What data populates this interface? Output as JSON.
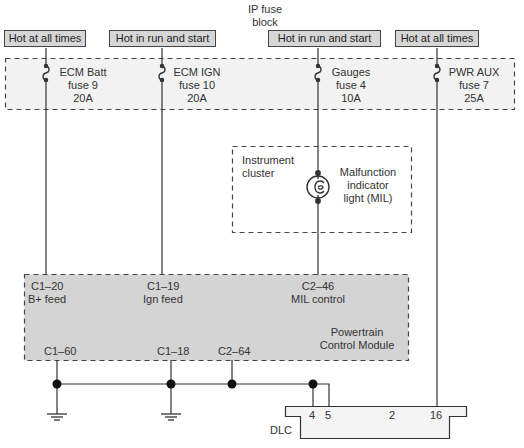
{
  "fuse_block": {
    "title_line1": "IP fuse",
    "title_line2": "block"
  },
  "power_labels": [
    {
      "label": "Hot at all times"
    },
    {
      "label": "Hot in run and start"
    },
    {
      "label": "Hot in run and start"
    },
    {
      "label": "Hot at all times"
    }
  ],
  "fuses": [
    {
      "name": "ECM Batt",
      "number": "fuse 9",
      "rating": "20A"
    },
    {
      "name": "ECM IGN",
      "number": "fuse 10",
      "rating": "20A"
    },
    {
      "name": "Gauges",
      "number": "fuse 4",
      "rating": "10A"
    },
    {
      "name": "PWR AUX",
      "number": "fuse 7",
      "rating": "25A"
    }
  ],
  "instrument_cluster": {
    "title_line1": "Instrument",
    "title_line2": "cluster",
    "lamp_line1": "Malfunction",
    "lamp_line2": "indicator",
    "lamp_line3": "light (MIL)"
  },
  "pcm": {
    "inputs": [
      {
        "pin": "C1–20",
        "desc": "B+ feed"
      },
      {
        "pin": "C1–19",
        "desc": "Ign feed"
      },
      {
        "pin": "C2–46",
        "desc": "MIL control"
      }
    ],
    "title_line1": "Powertrain",
    "title_line2": "Control Module",
    "grounds": [
      {
        "pin": "C1–60"
      },
      {
        "pin": "C1–18"
      },
      {
        "pin": "C2–64"
      }
    ]
  },
  "dlc": {
    "label": "DLC",
    "pins": [
      "4",
      "5",
      "2",
      "16"
    ]
  },
  "colors": {
    "line": "#333333",
    "fuse_block_fill": "#f2f2f2",
    "pcm_fill": "#d4d4d4",
    "label_box_fill": "#d6d6d6",
    "dlc_fill": "#f4f4f4"
  }
}
